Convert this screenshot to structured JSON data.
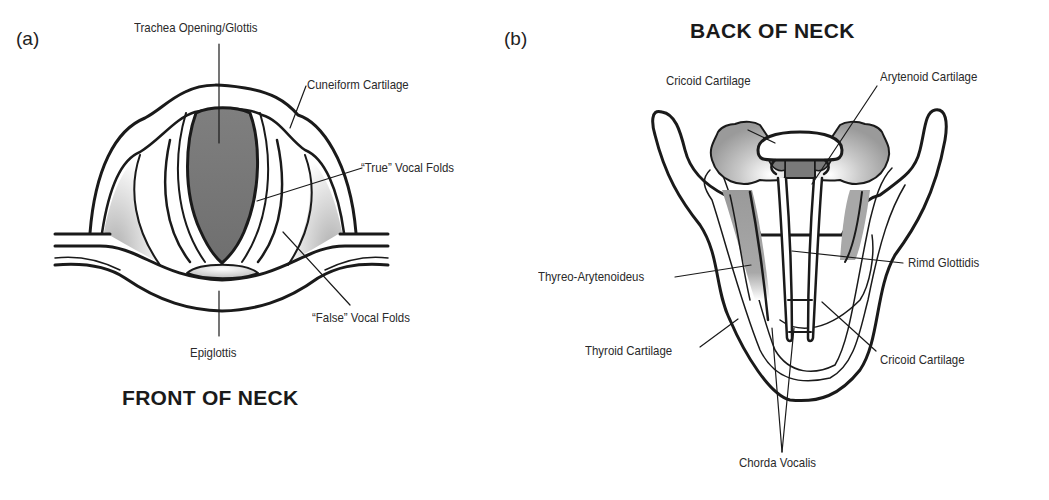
{
  "figure": {
    "panel_a": {
      "letter": "(a)",
      "caption": "FRONT OF NECK",
      "labels": {
        "trachea": "Trachea Opening/Glottis",
        "cuneiform": "Cuneiform Cartilage",
        "true_folds": "“True” Vocal Folds",
        "false_folds": "“False” Vocal Folds",
        "epiglottis": "Epiglottis"
      }
    },
    "panel_b": {
      "letter": "(b)",
      "caption": "BACK OF NECK",
      "labels": {
        "cricoid_top": "Cricoid Cartilage",
        "arytenoid": "Arytenoid Cartilage",
        "thyreo": "Thyreo-Arytenoideus",
        "rimd": "Rimd Glottidis",
        "thyroid": "Thyroid Cartilage",
        "cricoid_bottom": "Cricoid Cartilage",
        "chorda": "Chorda Vocalis"
      }
    },
    "colors": {
      "outline": "#1a1a1a",
      "dark_fill": "#7a7a7a",
      "mid_fill": "#a8a8a8",
      "light_fill": "#e6e6e6",
      "background": "#ffffff"
    }
  }
}
